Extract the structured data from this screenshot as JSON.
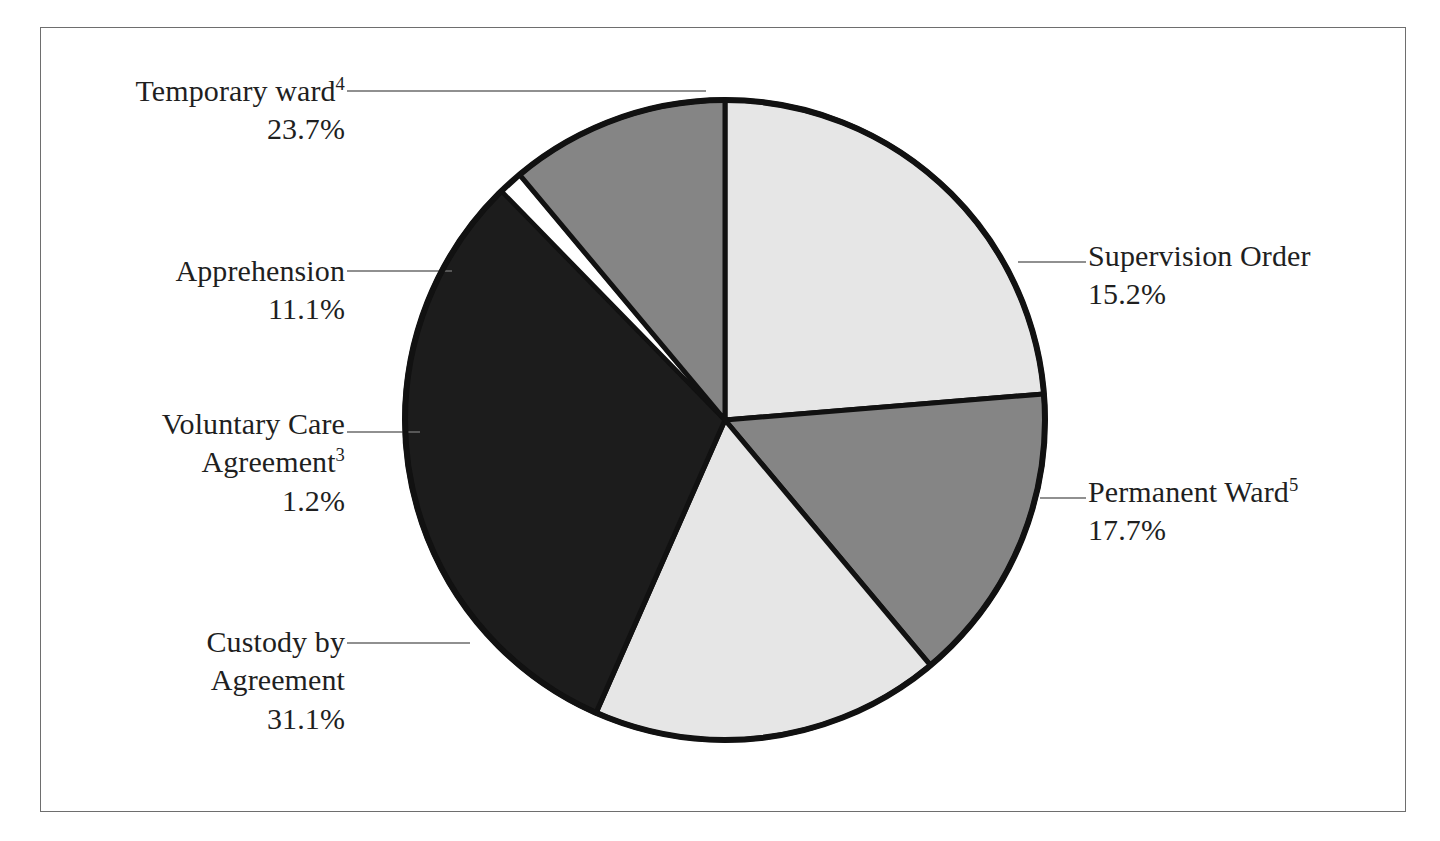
{
  "figure": {
    "background_color": "#ffffff",
    "frame_color": "#6e6e6e",
    "outline_color": "#111111"
  },
  "chart_data": {
    "type": "pie",
    "title": "",
    "subtitle": "",
    "xlabel": "",
    "ylabel": "",
    "legend_position": "none",
    "grid": false,
    "units": "percent",
    "total": 100.0,
    "start_angle_deg": 0,
    "direction": "clockwise",
    "categories": [
      "Temporary ward4",
      "Supervision Order",
      "Permanent Ward5",
      "Custody by Agreement",
      "Voluntary Care Agreement3",
      "Apprehension"
    ],
    "values": [
      23.7,
      15.2,
      17.7,
      31.1,
      1.2,
      11.1
    ],
    "slices": [
      {
        "name": "temporary-ward",
        "label": "Temporary ward",
        "footnote": "4",
        "value": 23.7,
        "value_text": "23.7%",
        "color": "#e6e6e6",
        "start_deg": 0.0,
        "end_deg": 85.32
      },
      {
        "name": "supervision-order",
        "label": "Supervision Order",
        "footnote": "",
        "value": 15.2,
        "value_text": "15.2%",
        "color": "#858585",
        "start_deg": 85.32,
        "end_deg": 90.0
      },
      {
        "name": "permanent-ward",
        "label": "Permanent Ward",
        "footnote": "5",
        "value": 17.7,
        "value_text": "17.7%",
        "color": "#e6e6e6",
        "start_deg": 90.0,
        "end_deg": 153.72
      },
      {
        "name": "custody-by-agreement",
        "label": "Custody by Agreement",
        "label_line1": "Custody by",
        "label_line2": "Agreement",
        "footnote": "",
        "value": 31.1,
        "value_text": "31.1%",
        "color": "#1c1c1c",
        "start_deg": 153.72,
        "end_deg": 265.68
      },
      {
        "name": "voluntary-care-agreement",
        "label": "Voluntary Care Agreement",
        "label_line1": "Voluntary Care",
        "label_line2": "Agreement",
        "footnote": "3",
        "value": 1.2,
        "value_text": "1.2%",
        "color": "#ffffff",
        "start_deg": 265.68,
        "end_deg": 270.0
      },
      {
        "name": "apprehension",
        "label": "Apprehension",
        "footnote": "",
        "value": 11.1,
        "value_text": "11.1%",
        "color": "#858585",
        "start_deg": 270.0,
        "end_deg": 310.0
      }
    ]
  },
  "labels": {
    "temporary_ward": {
      "text": "Temporary ward",
      "footnote": "4",
      "value": "23.7%"
    },
    "apprehension": {
      "text": "Apprehension",
      "footnote": "",
      "value": "11.1%"
    },
    "voluntary_care": {
      "line1": "Voluntary Care",
      "line2": "Agreement",
      "footnote": "3",
      "value": "1.2%"
    },
    "custody": {
      "line1": "Custody by",
      "line2": "Agreement",
      "value": "31.1%"
    },
    "supervision_order": {
      "text": "Supervision Order",
      "value": "15.2%"
    },
    "permanent_ward": {
      "text": "Permanent Ward",
      "footnote": "5",
      "value": "17.7%"
    }
  }
}
